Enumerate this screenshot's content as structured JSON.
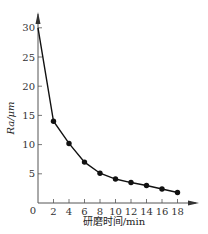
{
  "chart_data": {
    "type": "line",
    "title": "",
    "xlabel": "研磨时间/min",
    "ylabel": "Ra/μm",
    "x": [
      0,
      2,
      4,
      6,
      8,
      10,
      12,
      14,
      16,
      18
    ],
    "series": [
      {
        "name": "Ra",
        "values": [
          30,
          14,
          10.2,
          7,
          5.1,
          4.1,
          3.5,
          3.0,
          2.4,
          1.8
        ],
        "markers": [
          false,
          true,
          true,
          true,
          true,
          true,
          true,
          true,
          true,
          true
        ]
      }
    ],
    "x_ticks": [
      "0",
      "2",
      "4",
      "6",
      "8",
      "10",
      "12",
      "14",
      "16",
      "18"
    ],
    "y_ticks": [
      "5",
      "10",
      "15",
      "20",
      "25",
      "30"
    ],
    "xlim": [
      0,
      20
    ],
    "ylim": [
      0,
      33
    ],
    "grid": false,
    "legend": "none",
    "colors": {
      "line": "#111111",
      "axis": "#555555"
    }
  }
}
